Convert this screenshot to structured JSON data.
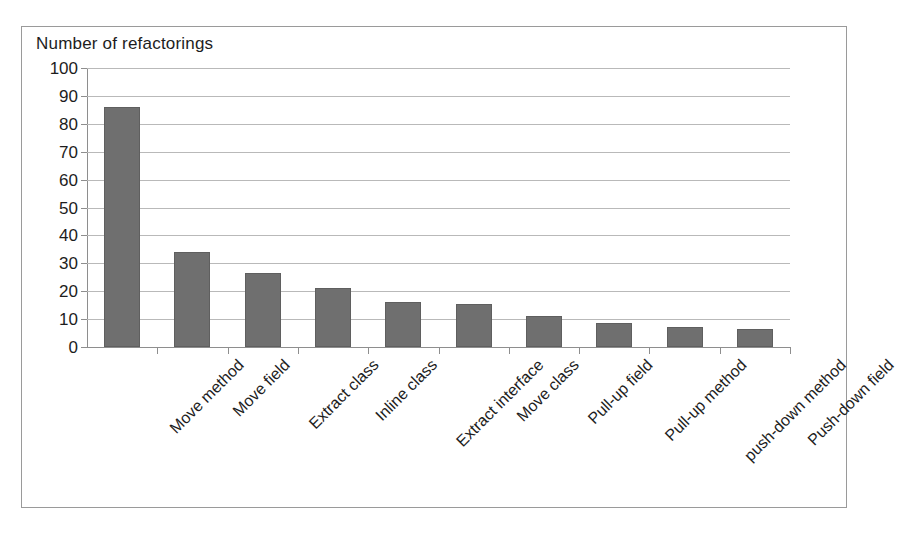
{
  "figure": {
    "title": "Number of refactorings",
    "frame_color": "#9a9a9a",
    "background": "#ffffff"
  },
  "chart_data": {
    "type": "bar",
    "title": "Number of refactorings",
    "xlabel": "",
    "ylabel": "Number of refactorings",
    "ylim": [
      0,
      100
    ],
    "ytick_step": 10,
    "yticks": [
      0,
      10,
      20,
      30,
      40,
      50,
      60,
      70,
      80,
      90,
      100
    ],
    "grid": "horizontal",
    "legend": "none",
    "bar_color": "#6f6f6f",
    "label_rotation_deg": -45,
    "categories": [
      "Move method",
      "Move field",
      "Extract class",
      "Inline class",
      "Extract interface",
      "Move class",
      "Pull-up field",
      "Pull-up method",
      "push-down method",
      "Push-down field"
    ],
    "values": [
      86,
      34,
      26.5,
      21,
      16,
      15.5,
      11,
      8.5,
      7,
      6.5
    ]
  }
}
